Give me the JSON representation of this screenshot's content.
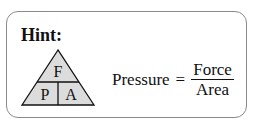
{
  "hint": {
    "label": "Hint:"
  },
  "triangle": {
    "top": "F",
    "bottom_left": "P",
    "bottom_right": "A",
    "fill": "#dcdcdc"
  },
  "equation": {
    "lhs": "Pressure",
    "equals": "=",
    "numerator": "Force",
    "denominator": "Area"
  }
}
